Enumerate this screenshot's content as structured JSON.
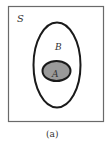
{
  "diagram": {
    "type": "venn",
    "universe_label": "S",
    "sets": [
      {
        "label": "B",
        "contains": [
          "A"
        ]
      },
      {
        "label": "A",
        "subset_of": "B",
        "fill": "#9a9a9a"
      }
    ],
    "caption": "(a)",
    "colors": {
      "stroke": "#1a1a1a",
      "frame": "#6a6a6a",
      "fill_A": "#9a9a9a",
      "background": "#ffffff"
    }
  }
}
